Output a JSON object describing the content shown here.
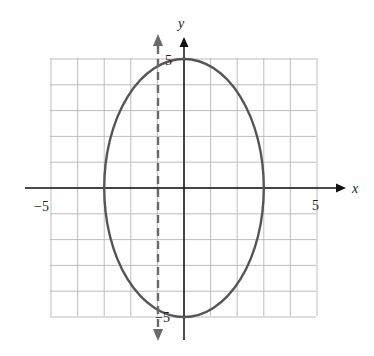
{
  "chart_data": {
    "type": "line",
    "title": "",
    "xlabel": "x",
    "ylabel": "y",
    "xlim": [
      -5,
      5
    ],
    "ylim": [
      -5,
      5
    ],
    "grid": true,
    "grid_step": 1,
    "x_tick_labels": [
      {
        "value": -5,
        "label": "−5"
      },
      {
        "value": 5,
        "label": "5"
      }
    ],
    "y_tick_labels": [
      {
        "value": 5,
        "label": "5"
      },
      {
        "value": -5,
        "label": "−5"
      }
    ],
    "series": [
      {
        "name": "ellipse",
        "kind": "ellipse",
        "center": [
          0,
          0
        ],
        "semi_axis_x": 3,
        "semi_axis_y": 5,
        "equation": "x^2/9 + y^2/25 = 1",
        "style": "solid",
        "color": "#555555"
      },
      {
        "name": "vertical-line",
        "kind": "vertical_line",
        "x": -1,
        "style": "dashed",
        "arrows": "both",
        "color": "#6a6a6a"
      }
    ]
  },
  "labels": {
    "x_axis": "x",
    "y_axis": "y",
    "x_min": "−5",
    "x_max": "5",
    "y_max": "5",
    "y_min": "−5"
  },
  "colors": {
    "grid": "#bdbdbd",
    "axis": "#111111",
    "ellipse": "#555555",
    "dashed": "#6a6a6a"
  }
}
